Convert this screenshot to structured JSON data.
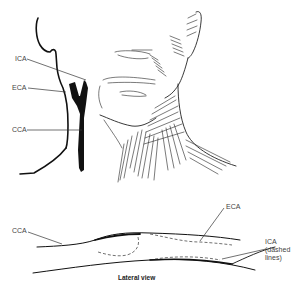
{
  "figure": {
    "top_view": {
      "labels": [
        {
          "id": "ica",
          "text": "ICA"
        },
        {
          "id": "eca",
          "text": "ECA"
        },
        {
          "id": "cca",
          "text": "CCA"
        }
      ]
    },
    "lateral_view": {
      "caption": "Lateral view",
      "labels": [
        {
          "id": "cca",
          "text": "CCA"
        },
        {
          "id": "eca",
          "text": "ECA"
        },
        {
          "id": "ica",
          "text": "ICA"
        },
        {
          "id": "ica_note_1",
          "text": "(dashed"
        },
        {
          "id": "ica_note_2",
          "text": "lines)"
        }
      ]
    },
    "colors": {
      "ink": "#111111",
      "label": "#444444",
      "background": "#ffffff"
    }
  }
}
